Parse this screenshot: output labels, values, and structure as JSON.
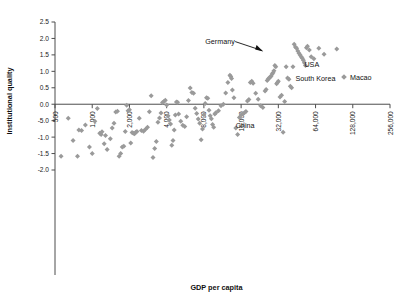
{
  "chart_data": {
    "type": "scatter",
    "title": "",
    "xlabel": "GDP per capita",
    "ylabel": "Institutional quality",
    "grid": false,
    "legend_position": "inside-right",
    "x_scale": "log2",
    "x_ticks": [
      "500",
      "1,000",
      "2,000",
      "4,000",
      "8,000",
      "16,000",
      "32,000",
      "64,000",
      "128,000",
      "256,000"
    ],
    "x_tick_values": [
      500,
      1000,
      2000,
      4000,
      8000,
      16000,
      32000,
      64000,
      128000,
      256000
    ],
    "xlim": [
      500,
      256000
    ],
    "y_ticks": [
      "2.5",
      "2.0",
      "1.5",
      "1.0",
      "0.5",
      "0.0",
      "-5.0",
      "-1.0",
      "-1.5",
      "-2.0"
    ],
    "y_tick_values": [
      2.5,
      2.0,
      1.5,
      1.0,
      0.5,
      0.0,
      -0.5,
      -1.0,
      -1.5,
      -2.0
    ],
    "ylim": [
      -2.0,
      2.5
    ],
    "marker": "diamond",
    "marker_color": "#9a9a9a",
    "legend": [
      {
        "label": "Macao",
        "marker": "diamond",
        "color": "#9a9a9a"
      }
    ],
    "annotations": [
      {
        "text": "Germany",
        "x": 26000,
        "y": 1.57,
        "has_arrow": true
      },
      {
        "text": "USA",
        "x": 52000,
        "y": 1.13
      },
      {
        "text": "South Korea",
        "x": 44000,
        "y": 0.7
      },
      {
        "text": "China",
        "x": 14500,
        "y": -0.72
      }
    ],
    "series": [
      {
        "name": "Countries",
        "points": [
          [
            560,
            -1.58
          ],
          [
            760,
            -1.58
          ],
          [
            700,
            -1.1
          ],
          [
            640,
            -0.43
          ],
          [
            820,
            -0.8
          ],
          [
            880,
            -0.63
          ],
          [
            780,
            -0.78
          ],
          [
            950,
            -1.3
          ],
          [
            1000,
            -1.5
          ],
          [
            1050,
            -0.52
          ],
          [
            1100,
            -0.13
          ],
          [
            1150,
            -0.88
          ],
          [
            1180,
            -0.92
          ],
          [
            1200,
            -0.84
          ],
          [
            1250,
            -1.2
          ],
          [
            1280,
            -0.95
          ],
          [
            1320,
            -1.38
          ],
          [
            1400,
            -1.05
          ],
          [
            1450,
            -0.72
          ],
          [
            1500,
            -0.58
          ],
          [
            1550,
            -0.24
          ],
          [
            1600,
            -0.21
          ],
          [
            1650,
            -1.58
          ],
          [
            1700,
            -1.5
          ],
          [
            1750,
            -1.3
          ],
          [
            1800,
            -1.28
          ],
          [
            1850,
            -0.83
          ],
          [
            1900,
            -0.03
          ],
          [
            1950,
            -0.2
          ],
          [
            2000,
            -0.17
          ],
          [
            2050,
            -1.18
          ],
          [
            2100,
            -0.86
          ],
          [
            2150,
            -0.88
          ],
          [
            2200,
            -0.9
          ],
          [
            2250,
            -0.85
          ],
          [
            2300,
            -0.83
          ],
          [
            2400,
            -0.43
          ],
          [
            2500,
            -0.8
          ],
          [
            2600,
            -0.82
          ],
          [
            2700,
            -0.76
          ],
          [
            2800,
            -0.7
          ],
          [
            2900,
            -0.23
          ],
          [
            3000,
            0.26
          ],
          [
            3100,
            -1.62
          ],
          [
            3200,
            -1.35
          ],
          [
            3300,
            -1.13
          ],
          [
            3400,
            -0.55
          ],
          [
            3500,
            -0.42
          ],
          [
            3600,
            -0.27
          ],
          [
            3700,
            0.05
          ],
          [
            3800,
            0.08
          ],
          [
            3900,
            0.12
          ],
          [
            4000,
            -0.02
          ],
          [
            4100,
            -0.35
          ],
          [
            4200,
            -0.48
          ],
          [
            4300,
            -0.6
          ],
          [
            4400,
            -1.25
          ],
          [
            4500,
            -1.1
          ],
          [
            4600,
            -0.78
          ],
          [
            4700,
            -0.33
          ],
          [
            4800,
            0.07
          ],
          [
            4900,
            0.06
          ],
          [
            5000,
            -0.3
          ],
          [
            5200,
            -0.52
          ],
          [
            5400,
            -0.64
          ],
          [
            5600,
            -0.68
          ],
          [
            5800,
            -0.38
          ],
          [
            6000,
            0.11
          ],
          [
            6200,
            0.49
          ],
          [
            6400,
            0.36
          ],
          [
            6600,
            0.33
          ],
          [
            6800,
            -0.12
          ],
          [
            7000,
            -0.28
          ],
          [
            7200,
            -0.45
          ],
          [
            7400,
            -0.58
          ],
          [
            7600,
            -1.08
          ],
          [
            7800,
            -0.75
          ],
          [
            8000,
            -0.32
          ],
          [
            8200,
            0.02
          ],
          [
            8400,
            0.2
          ],
          [
            8600,
            0.18
          ],
          [
            8800,
            -0.18
          ],
          [
            9000,
            -0.35
          ],
          [
            9200,
            -0.44
          ],
          [
            9400,
            -0.62
          ],
          [
            9600,
            -0.7
          ],
          [
            9800,
            -0.3
          ],
          [
            10000,
            -0.26
          ],
          [
            10500,
            -0.2
          ],
          [
            11000,
            -0.05
          ],
          [
            11500,
            0.0
          ],
          [
            12000,
            0.34
          ],
          [
            12500,
            0.66
          ],
          [
            13000,
            0.88
          ],
          [
            13200,
            0.84
          ],
          [
            13400,
            0.78
          ],
          [
            13600,
            0.43
          ],
          [
            14000,
            0.2
          ],
          [
            14500,
            -0.72
          ],
          [
            15000,
            -0.92
          ],
          [
            15500,
            -0.4
          ],
          [
            16000,
            -0.33
          ],
          [
            16500,
            -0.3
          ],
          [
            17000,
            -0.26
          ],
          [
            17500,
            -0.22
          ],
          [
            18000,
            0.1
          ],
          [
            18500,
            0.14
          ],
          [
            19000,
            0.66
          ],
          [
            19500,
            0.7
          ],
          [
            20000,
            0.64
          ],
          [
            21000,
            0.33
          ],
          [
            22000,
            0.15
          ],
          [
            23000,
            -0.05
          ],
          [
            24000,
            -0.1
          ],
          [
            25000,
            0.4
          ],
          [
            25500,
            0.45
          ],
          [
            26000,
            0.72
          ],
          [
            26500,
            0.77
          ],
          [
            27000,
            0.8
          ],
          [
            27500,
            0.83
          ],
          [
            28000,
            0.86
          ],
          [
            28500,
            0.92
          ],
          [
            29000,
            0.96
          ],
          [
            29500,
            1.02
          ],
          [
            30000,
            1.18
          ],
          [
            30500,
            1.14
          ],
          [
            31000,
            0.62
          ],
          [
            31500,
            0.66
          ],
          [
            32000,
            0.7
          ],
          [
            33000,
            0.22
          ],
          [
            34000,
            0.27
          ],
          [
            35000,
            -0.85
          ],
          [
            36000,
            0.08
          ],
          [
            37000,
            1.14
          ],
          [
            38000,
            0.8
          ],
          [
            39000,
            0.76
          ],
          [
            40000,
            0.55
          ],
          [
            41000,
            0.5
          ],
          [
            42000,
            1.14
          ],
          [
            43000,
            1.82
          ],
          [
            44000,
            1.74
          ],
          [
            45000,
            1.7
          ],
          [
            46000,
            1.62
          ],
          [
            47000,
            1.55
          ],
          [
            48000,
            1.5
          ],
          [
            49000,
            1.44
          ],
          [
            50000,
            1.4
          ],
          [
            51000,
            1.34
          ],
          [
            52000,
            1.26
          ],
          [
            53000,
            1.18
          ],
          [
            54000,
            1.72
          ],
          [
            55000,
            1.76
          ],
          [
            57000,
            1.65
          ],
          [
            59000,
            1.44
          ],
          [
            62000,
            1.38
          ],
          [
            68000,
            1.7
          ],
          [
            75000,
            1.52
          ],
          [
            95000,
            1.68
          ]
        ]
      }
    ]
  },
  "legend_item_macao": "Macao",
  "axis": {
    "x_title": "GDP per capita",
    "y_title": "Institutional quality"
  }
}
